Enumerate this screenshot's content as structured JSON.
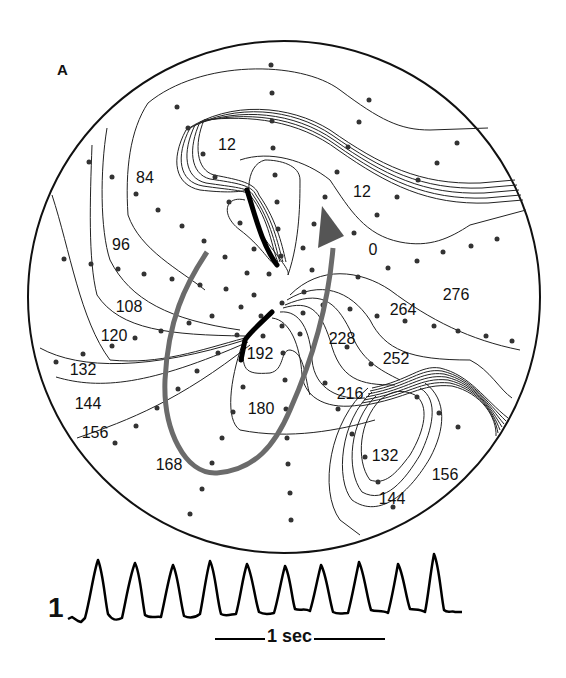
{
  "panel": {
    "label": "A"
  },
  "map": {
    "boundary": {
      "cx": 284,
      "cy": 297,
      "r": 256
    },
    "isochrone_labels": [
      {
        "text": "12",
        "x": 227,
        "y": 150
      },
      {
        "text": "84",
        "x": 145,
        "y": 183
      },
      {
        "text": "12",
        "x": 362,
        "y": 197
      },
      {
        "text": "96",
        "x": 121,
        "y": 250
      },
      {
        "text": "0",
        "x": 373,
        "y": 255
      },
      {
        "text": "276",
        "x": 456,
        "y": 300
      },
      {
        "text": "264",
        "x": 403,
        "y": 315
      },
      {
        "text": "108",
        "x": 129,
        "y": 312
      },
      {
        "text": "120",
        "x": 114,
        "y": 341
      },
      {
        "text": "228",
        "x": 342,
        "y": 344
      },
      {
        "text": "192",
        "x": 260,
        "y": 359
      },
      {
        "text": "252",
        "x": 396,
        "y": 364
      },
      {
        "text": "132",
        "x": 83,
        "y": 375
      },
      {
        "text": "216",
        "x": 350,
        "y": 399
      },
      {
        "text": "144",
        "x": 88,
        "y": 409
      },
      {
        "text": "180",
        "x": 261,
        "y": 414
      },
      {
        "text": "156",
        "x": 95,
        "y": 438
      },
      {
        "text": "132",
        "x": 385,
        "y": 461
      },
      {
        "text": "168",
        "x": 169,
        "y": 470
      },
      {
        "text": "156",
        "x": 445,
        "y": 480
      },
      {
        "text": "144",
        "x": 392,
        "y": 504
      }
    ],
    "units": "ms",
    "activation_arrow": {
      "color": "#6b6b6b",
      "description": "re-entrant circuit"
    },
    "block_lines": {
      "color": "#000000"
    }
  },
  "trace": {
    "lead_label": "1",
    "scale_bar_label": "1 sec",
    "beats": 10
  }
}
